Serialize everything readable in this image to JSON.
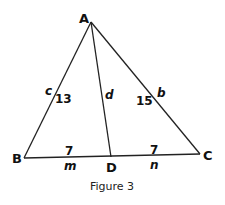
{
  "figure": {
    "caption": "Figure 3",
    "vertices": {
      "A": {
        "label": "A",
        "x": 91,
        "y": 22
      },
      "B": {
        "label": "B",
        "x": 24,
        "y": 158
      },
      "C": {
        "label": "C",
        "x": 200,
        "y": 154
      },
      "D": {
        "label": "D",
        "x": 111,
        "y": 157
      }
    },
    "segments": [
      {
        "name": "AB",
        "from": "A",
        "to": "B",
        "side_label": "c",
        "length": "13"
      },
      {
        "name": "AC",
        "from": "A",
        "to": "C",
        "side_label": "b",
        "length": "15"
      },
      {
        "name": "AD",
        "from": "A",
        "to": "D",
        "side_label": "d"
      },
      {
        "name": "BD",
        "from": "B",
        "to": "D",
        "side_label": "m",
        "length": "7"
      },
      {
        "name": "DC",
        "from": "D",
        "to": "C",
        "side_label": "n",
        "length": "7"
      }
    ],
    "labels": {
      "c": "c",
      "ab_len": "13",
      "d": "d",
      "ac_len": "15",
      "b": "b",
      "bd_len": "7",
      "m": "m",
      "dc_len": "7",
      "n": "n"
    }
  }
}
